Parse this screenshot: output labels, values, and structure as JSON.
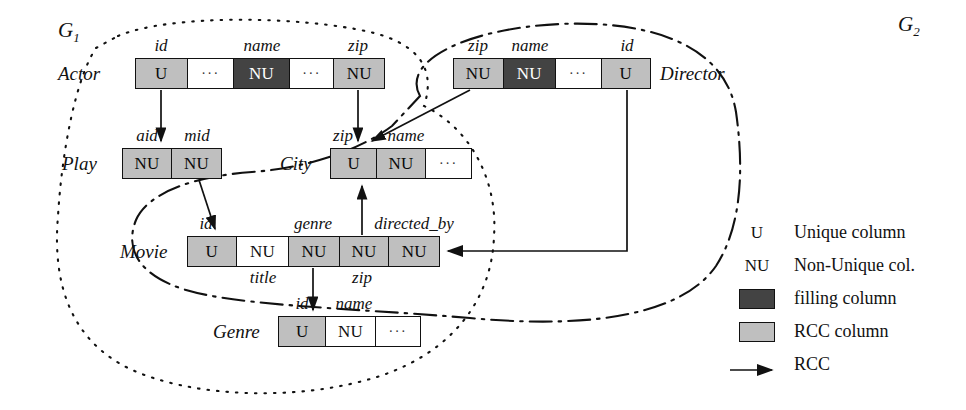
{
  "figure": {
    "regions": [
      {
        "id": "g1",
        "label": "G",
        "subscript": "1",
        "style": "dotted"
      },
      {
        "id": "g2",
        "label": "G",
        "subscript": "2",
        "style": "dash-dot"
      }
    ],
    "relations": [
      {
        "id": "actor",
        "name": "Actor",
        "name_side": "left",
        "x": 135,
        "y": 58,
        "width": 250,
        "height": 31,
        "columns": [
          {
            "label": "id",
            "value": "U",
            "fill": "rcc",
            "width": 52,
            "label_pos": "above"
          },
          {
            "label": "",
            "value": "···",
            "fill": "plain",
            "width": 47,
            "label_pos": "none"
          },
          {
            "label": "name",
            "value": "NU",
            "fill": "filling",
            "width": 56,
            "label_pos": "above"
          },
          {
            "label": "",
            "value": "···",
            "fill": "plain",
            "width": 45,
            "label_pos": "none"
          },
          {
            "label": "zip",
            "value": "NU",
            "fill": "rcc",
            "width": 50,
            "label_pos": "above"
          }
        ]
      },
      {
        "id": "director",
        "name": "Director",
        "name_side": "right",
        "x": 453,
        "y": 58,
        "width": 198,
        "height": 31,
        "columns": [
          {
            "label": "zip",
            "value": "NU",
            "fill": "rcc",
            "width": 50,
            "label_pos": "above"
          },
          {
            "label": "name",
            "value": "NU",
            "fill": "filling",
            "width": 53,
            "label_pos": "above"
          },
          {
            "label": "",
            "value": "···",
            "fill": "plain",
            "width": 46,
            "label_pos": "none"
          },
          {
            "label": "id",
            "value": "U",
            "fill": "rcc",
            "width": 49,
            "label_pos": "above"
          }
        ]
      },
      {
        "id": "play",
        "name": "Play",
        "name_side": "left",
        "x": 122,
        "y": 148,
        "width": 100,
        "height": 31,
        "columns": [
          {
            "label": "aid",
            "value": "NU",
            "fill": "rcc",
            "width": 50,
            "label_pos": "above"
          },
          {
            "label": "mid",
            "value": "NU",
            "fill": "rcc",
            "width": 50,
            "label_pos": "above"
          }
        ]
      },
      {
        "id": "city",
        "name": "City",
        "name_side": "left",
        "x": 330,
        "y": 148,
        "width": 142,
        "height": 31,
        "columns": [
          {
            "label": "zip",
            "value": "U",
            "fill": "rcc",
            "width": 47,
            "label_pos": "above"
          },
          {
            "label": "name",
            "value": "NU",
            "fill": "rcc",
            "width": 49,
            "label_pos": "above"
          },
          {
            "label": "",
            "value": "···",
            "fill": "plain",
            "width": 46,
            "label_pos": "none"
          }
        ]
      },
      {
        "id": "movie",
        "name": "Movie",
        "name_side": "left",
        "x": 187,
        "y": 236,
        "width": 253,
        "height": 31,
        "columns": [
          {
            "label": "id",
            "value": "U",
            "fill": "rcc",
            "width": 49,
            "label_pos": "above"
          },
          {
            "label": "title",
            "value": "NU",
            "fill": "plain",
            "width": 53,
            "label_pos": "below"
          },
          {
            "label": "genre",
            "value": "NU",
            "fill": "rcc",
            "width": 51,
            "label_pos": "above"
          },
          {
            "label": "zip",
            "value": "NU",
            "fill": "rcc",
            "width": 50,
            "label_pos": "below"
          },
          {
            "label": "directed_by",
            "value": "NU",
            "fill": "rcc",
            "width": 50,
            "label_pos": "above"
          }
        ]
      },
      {
        "id": "genre",
        "name": "Genre",
        "name_side": "left",
        "x": 278,
        "y": 316,
        "width": 143,
        "height": 31,
        "columns": [
          {
            "label": "id",
            "value": "U",
            "fill": "rcc",
            "width": 48,
            "label_pos": "above"
          },
          {
            "label": "name",
            "value": "NU",
            "fill": "plain",
            "width": 50,
            "label_pos": "above"
          },
          {
            "label": "",
            "value": "···",
            "fill": "plain",
            "width": 45,
            "label_pos": "none"
          }
        ]
      }
    ],
    "rcc_edges": [
      {
        "from": "actor.id",
        "to": "play.aid"
      },
      {
        "from": "actor.zip",
        "to": "city.zip"
      },
      {
        "from": "play.mid",
        "to": "movie.id"
      },
      {
        "from": "movie.genre",
        "to": "genre.id"
      },
      {
        "from": "movie.zip",
        "to": "city.zip"
      },
      {
        "from": "director.zip",
        "to": "city.zip"
      },
      {
        "from": "director.id",
        "to": "movie.directed_by"
      }
    ]
  },
  "legend": {
    "rows": [
      {
        "key": "U",
        "kind": "text",
        "text": "Unique column"
      },
      {
        "key": "NU",
        "kind": "text",
        "text": "Non-Unique col."
      },
      {
        "key": "",
        "kind": "filling",
        "text": "filling column"
      },
      {
        "key": "",
        "kind": "rcc",
        "text": "RCC column"
      },
      {
        "key": "",
        "kind": "arrow",
        "text": "RCC"
      }
    ]
  },
  "colors": {
    "filling": "#434343",
    "rcc": "#bfbfbf",
    "plain": "#ffffff",
    "stroke": "#111111"
  }
}
